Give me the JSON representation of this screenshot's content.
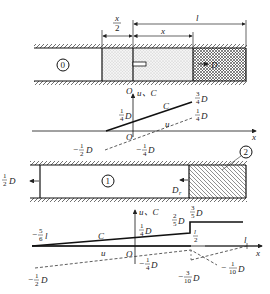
{
  "diagram": {
    "panel1": {
      "dimensions": {
        "half_x": "x",
        "half_x_den": "2",
        "x": "x",
        "l": "l"
      },
      "region_label": "0",
      "wave_label": "D"
    },
    "graph1": {
      "axis_origin": "O",
      "axis_vertical": "u、C",
      "axis_x": "x",
      "curve_C": "C",
      "curve_u": "u",
      "labels": {
        "c_start": {
          "num": "1",
          "den": "4",
          "unit": "D"
        },
        "c_end": {
          "num": "3",
          "den": "4",
          "unit": "D"
        },
        "u_end": {
          "num": "1",
          "den": "4",
          "unit": "D"
        },
        "u_start": {
          "sign": "−",
          "num": "1",
          "den": "2",
          "unit": "D"
        },
        "u_zero": {
          "sign": "−",
          "num": "1",
          "den": "4",
          "unit": "D"
        }
      }
    },
    "panel2": {
      "region1_label": "1",
      "region2_label": "2",
      "left_wave": {
        "num": "1",
        "den": "2",
        "unit": "D"
      },
      "reflected_wave": "D",
      "reflected_sub": "r"
    },
    "graph2": {
      "axis_origin": "O",
      "axis_vertical": "u、C",
      "axis_x": "x",
      "curve_C": "C",
      "curve_u": "u",
      "l_label": "l",
      "labels": {
        "c_left": {
          "sign": "−",
          "num": "5",
          "den": "6",
          "unit": "l"
        },
        "c_origin": {
          "num": "1",
          "den": "4",
          "unit": "D"
        },
        "c_jump_low": {
          "num": "2",
          "den": "5",
          "unit": "D"
        },
        "c_jump_high": {
          "num": "3",
          "den": "5",
          "unit": "D"
        },
        "half_l": {
          "num": "l",
          "den": "2"
        },
        "u_left": {
          "sign": "−",
          "num": "1",
          "den": "2",
          "unit": "D"
        },
        "u_origin": {
          "sign": "−",
          "num": "1",
          "den": "4",
          "unit": "D"
        },
        "u_jump": {
          "sign": "−",
          "num": "3",
          "den": "10",
          "unit": "D"
        },
        "u_right": {
          "sign": "−",
          "num": "1",
          "den": "10",
          "unit": "D"
        }
      }
    }
  }
}
